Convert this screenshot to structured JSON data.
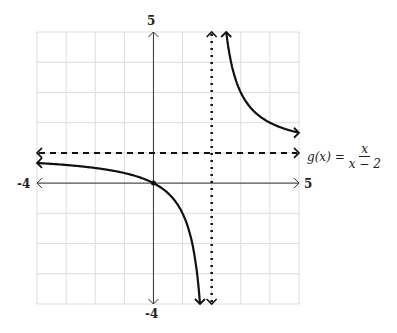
{
  "chart_data": {
    "type": "line",
    "title": "",
    "function_label": {
      "lhs": "g(x) =",
      "numerator": "x",
      "denominator": "x − 2"
    },
    "xlim": [
      -4,
      5
    ],
    "ylim": [
      -4,
      5
    ],
    "x_tick_labels": {
      "min": "-4",
      "max": "5"
    },
    "y_tick_labels": {
      "min": "-4",
      "max": "5"
    },
    "grid": true,
    "series": [
      {
        "name": "g(x) = x/(x-2)",
        "style": "solid",
        "branches": [
          "x < 2",
          "x > 2"
        ]
      }
    ],
    "asymptotes": [
      {
        "type": "vertical",
        "x": 2,
        "style": "dotted"
      },
      {
        "type": "horizontal",
        "y": 1,
        "style": "dashed"
      }
    ],
    "points": [
      {
        "x": 0,
        "y": 0
      }
    ]
  }
}
